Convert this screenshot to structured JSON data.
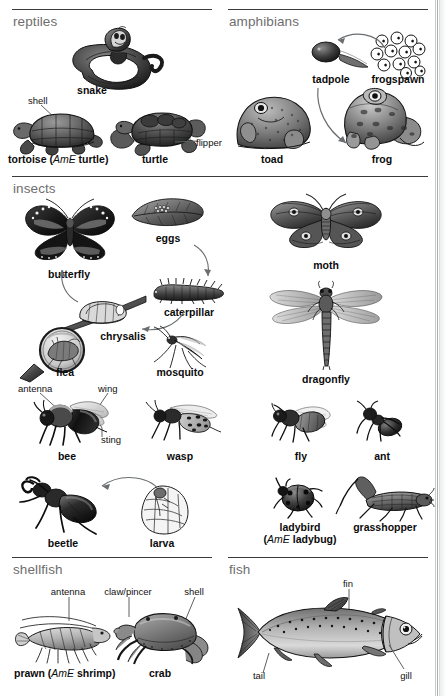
{
  "page": {
    "background": "#ffffff",
    "rule_color": "#3a3a3a",
    "section_heading_color": "#6e6e6e",
    "caption_color": "#0b0b0b",
    "leader_color": "#5d6163"
  },
  "sections": [
    {
      "id": "reptiles",
      "title": "reptiles"
    },
    {
      "id": "amphibians",
      "title": "amphibians"
    },
    {
      "id": "insects",
      "title": "insects"
    },
    {
      "id": "shellfish",
      "title": "shellfish"
    },
    {
      "id": "fish",
      "title": "fish"
    }
  ],
  "reptiles": {
    "title": "reptiles",
    "snake": "snake",
    "shell_callout": "shell",
    "flipper_callout": "flipper",
    "tortoise_main": "tortoise",
    "tortoise_ame_open": " (",
    "tortoise_ame_tag": "AmE",
    "tortoise_ame_word": " turtle",
    "tortoise_ame_close": ")",
    "turtle": "turtle"
  },
  "amphibians": {
    "title": "amphibians",
    "tadpole": "tadpole",
    "frogspawn": "frogspawn",
    "toad": "toad",
    "frog": "frog"
  },
  "insects": {
    "title": "insects",
    "butterfly": "butterfly",
    "eggs": "eggs",
    "caterpillar": "caterpillar",
    "chrysalis": "chrysalis",
    "flea": "flea",
    "mosquito": "mosquito",
    "moth": "moth",
    "dragonfly": "dragonfly",
    "antenna_callout": "antenna",
    "wing_callout": "wing",
    "sting_callout": "sting",
    "bee": "bee",
    "wasp": "wasp",
    "fly": "fly",
    "ant": "ant",
    "beetle": "beetle",
    "larva": "larva",
    "ladybird": "ladybird",
    "ladybird_ame_open": "(",
    "ladybird_ame_tag": "AmE",
    "ladybird_ame_word": " ladybug",
    "ladybird_ame_close": ")",
    "grasshopper": "grasshopper"
  },
  "shellfish": {
    "title": "shellfish",
    "antenna_callout": "antenna",
    "claw_callout": "claw/pincer",
    "shell_callout": "shell",
    "prawn_main": "prawn",
    "prawn_ame_open": " (",
    "prawn_ame_tag": "AmE",
    "prawn_ame_word": " shrimp",
    "prawn_ame_close": ")",
    "crab": "crab"
  },
  "fish": {
    "title": "fish",
    "fin_callout": "fin",
    "tail_callout": "tail",
    "gill_callout": "gill"
  }
}
